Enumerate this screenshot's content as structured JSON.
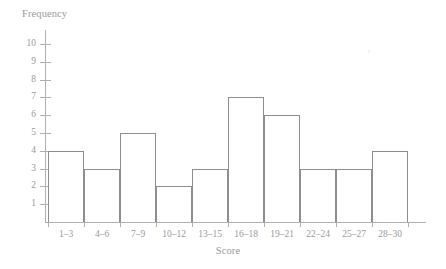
{
  "chart_data": {
    "type": "bar",
    "title": "",
    "xlabel": "Score",
    "ylabel": "Frequency",
    "categories": [
      "1–3",
      "4–6",
      "7–9",
      "10–12",
      "13–15",
      "16–18",
      "19–21",
      "22–24",
      "25–27",
      "28–30"
    ],
    "values": [
      4,
      3,
      5,
      2,
      3,
      7,
      6,
      3,
      3,
      4
    ],
    "ylim": [
      0,
      10
    ],
    "xlim": [
      0,
      10
    ],
    "yticks": [
      1,
      2,
      3,
      4,
      5,
      6,
      7,
      8,
      9,
      10
    ],
    "ytick_labels": [
      "1",
      "2",
      "3",
      "4",
      "5",
      "6",
      "7",
      "8",
      "9",
      "10"
    ],
    "grid": false,
    "legend": null,
    "legend_position": "none",
    "bar_fill_color": "#ffffff",
    "bar_edge_color": "#8e8e8e",
    "axis_color": "#b0b0b0",
    "text_color": "#9a9a9a",
    "background_color": "#ffffff"
  }
}
